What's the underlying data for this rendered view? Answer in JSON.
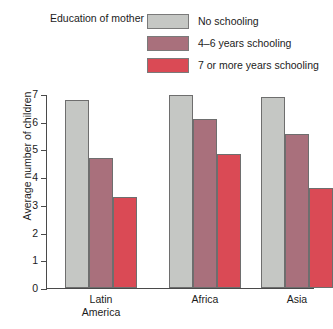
{
  "legend": {
    "title": "Education of mother",
    "items": [
      {
        "label": "No schooling",
        "color": "#c5c7c4"
      },
      {
        "label": "4–6 years schooling",
        "color": "#a9707c"
      },
      {
        "label": "7 or more years schooling",
        "color": "#da4a55"
      }
    ]
  },
  "axes": {
    "ylabel": "Average number of children",
    "yticks": [
      "7",
      "6",
      "5",
      "4",
      "3",
      "2",
      "1",
      "0"
    ]
  },
  "chart_data": {
    "type": "bar",
    "title": "",
    "xlabel": "",
    "ylabel": "Average number of children",
    "ylim": [
      0,
      7
    ],
    "yticks": [
      0,
      1,
      2,
      3,
      4,
      5,
      6,
      7
    ],
    "grid": false,
    "legend_position": "top-right",
    "legend_title": "Education of mother",
    "categories": [
      "Latin America",
      "Africa",
      "Asia"
    ],
    "category_labels_multiline": [
      "Latin\nAmerica",
      "Africa",
      "Asia"
    ],
    "series": [
      {
        "name": "No schooling",
        "color": "#c5c7c4",
        "values": [
          6.8,
          6.95,
          6.9
        ]
      },
      {
        "name": "4–6 years schooling",
        "color": "#a9707c",
        "values": [
          4.7,
          6.1,
          5.55
        ]
      },
      {
        "name": "7 or more years schooling",
        "color": "#da4a55",
        "values": [
          3.3,
          4.85,
          3.6
        ]
      }
    ]
  }
}
